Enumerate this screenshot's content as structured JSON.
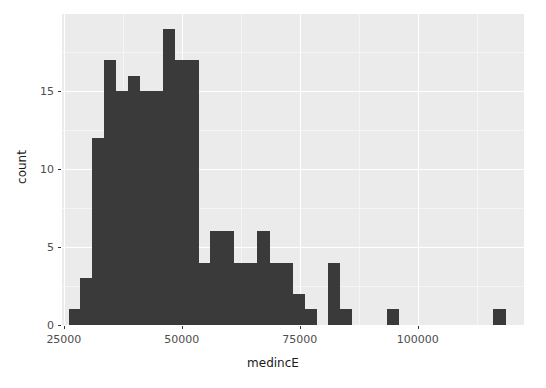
{
  "chart_data": {
    "type": "bar",
    "subtype": "histogram",
    "title": "",
    "xlabel": "medincE",
    "ylabel": "count",
    "xlim": [
      24600,
      122500
    ],
    "ylim": [
      0,
      19.95
    ],
    "grid": true,
    "legend": null,
    "bin_width": 2500,
    "bin_starts": [
      26000,
      28500,
      31000,
      33500,
      36000,
      38500,
      41000,
      43500,
      46000,
      48500,
      51000,
      53500,
      56000,
      58500,
      61000,
      63500,
      66000,
      68500,
      71000,
      73500,
      76000,
      78500,
      81000,
      83500,
      86000,
      88500,
      91000,
      93500,
      96000,
      98500,
      101000,
      103500,
      106000,
      108500,
      111000,
      113500,
      116000,
      118500
    ],
    "values": [
      1,
      3,
      12,
      17,
      15,
      16,
      15,
      15,
      19,
      17,
      17,
      4,
      6,
      6,
      4,
      4,
      6,
      4,
      4,
      2,
      1,
      0,
      4,
      1,
      0,
      0,
      0,
      1,
      0,
      0,
      0,
      0,
      0,
      0,
      0,
      0,
      1,
      0
    ],
    "x_ticks": [
      25000,
      50000,
      75000,
      100000
    ],
    "x_tick_labels": [
      "25000",
      "50000",
      "75000",
      "100000"
    ],
    "y_ticks": [
      0,
      5,
      10,
      15
    ],
    "y_tick_labels": [
      "0",
      "5",
      "10",
      "15"
    ],
    "y_minor_ticks": [
      2.5,
      7.5,
      12.5,
      17.5
    ],
    "x_minor_ticks": [
      37500,
      62500,
      87500,
      112500
    ],
    "colors": {
      "bar_fill": "#3a3a3a",
      "panel_background": "#ebebeb",
      "major_gridline": "#ffffff",
      "minor_gridline": "#f5f5f5",
      "axis_text": "#4d4d4d",
      "axis_title": "#1a1a1a",
      "figure_background": "#ffffff"
    }
  }
}
